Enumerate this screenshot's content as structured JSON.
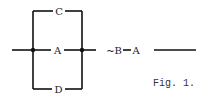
{
  "diagram": {
    "type": "switching-circuit",
    "parallel_branches": [
      {
        "label": "C",
        "position": "top"
      },
      {
        "label": "A",
        "position": "middle"
      },
      {
        "label": "D",
        "position": "bottom"
      }
    ],
    "series_elements": [
      {
        "label": "~B"
      },
      {
        "label": "A"
      }
    ],
    "caption": "Fig. 1.",
    "line_color": "#111111"
  }
}
